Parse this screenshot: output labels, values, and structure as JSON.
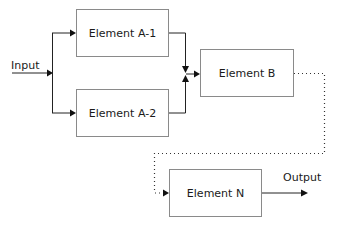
{
  "diagram": {
    "type": "block-flow",
    "nodes": [
      {
        "id": "a1",
        "label": "Element A-1"
      },
      {
        "id": "a2",
        "label": "Element A-2"
      },
      {
        "id": "b",
        "label": "Element B"
      },
      {
        "id": "n",
        "label": "Element N"
      }
    ],
    "io": {
      "input_label": "Input",
      "output_label": "Output"
    },
    "edges": [
      {
        "from": "input",
        "to": "a1",
        "style": "solid"
      },
      {
        "from": "input",
        "to": "a2",
        "style": "solid"
      },
      {
        "from": "a1",
        "to": "b",
        "style": "solid"
      },
      {
        "from": "a2",
        "to": "b",
        "style": "solid"
      },
      {
        "from": "b",
        "to": "n",
        "style": "dotted"
      },
      {
        "from": "n",
        "to": "output",
        "style": "solid"
      }
    ]
  }
}
